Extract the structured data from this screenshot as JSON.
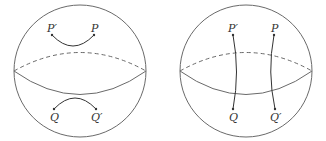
{
  "figure": {
    "panels": [
      {
        "id": "left",
        "description": "Sphere with two short arcs: P' to P in upper hemisphere, Q to Q' in lower hemisphere",
        "labels": {
          "p_prime": "P′",
          "p": "P",
          "q": "Q",
          "q_prime": "Q′"
        }
      },
      {
        "id": "right",
        "description": "Sphere with two curves crossing the equator: P' to Q and P to Q'",
        "labels": {
          "p_prime": "P′",
          "p": "P",
          "q": "Q",
          "q_prime": "Q′"
        }
      }
    ],
    "colors": {
      "outline": "#6a6a6a",
      "ink": "#333333",
      "background": "#ffffff"
    }
  }
}
